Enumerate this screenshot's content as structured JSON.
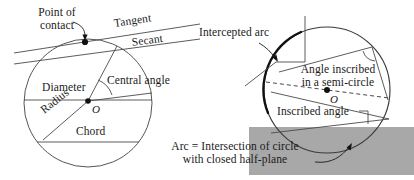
{
  "figure": {
    "background_color": "#ffffff",
    "ink_color": "#1a1a1a",
    "halfplane_color": "#a8a8a8"
  },
  "left_panel": {
    "circle": {
      "cx": 88,
      "cy": 103,
      "r": 64
    },
    "center_point_label": "O",
    "labels": {
      "point_of_contact_line1": "Point of",
      "point_of_contact_line2": "contact",
      "tangent": "Tangent",
      "secant": "Secant",
      "diameter": "Diameter",
      "central_angle": "Central angle",
      "radius": "Radius",
      "chord": "Chord"
    }
  },
  "right_panel": {
    "circle": {
      "cx": 327,
      "cy": 90,
      "r": 63
    },
    "center_point_label": "O",
    "labels": {
      "intercepted_arc": "Intercepted arc",
      "angle_inscribed_line1": "Angle inscribed",
      "angle_inscribed_line2": "in a semi-circle",
      "inscribed_angle": "Inscribed angle"
    }
  },
  "caption": {
    "line1": "Arc = Intersection of circle",
    "line2": "with closed half-plane"
  }
}
